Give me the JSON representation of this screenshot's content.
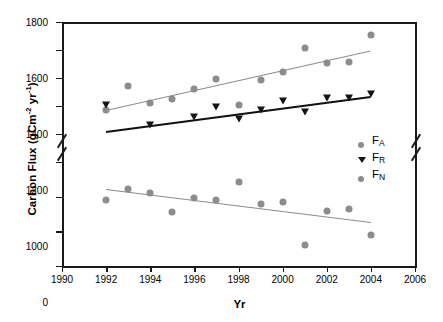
{
  "chart_data": {
    "type": "scatter",
    "title": "",
    "xlabel": "Yr",
    "ylabel": "Carbon Flux (gCm-2 yr-1)",
    "ylabel_parts": {
      "prefix": "Carbon Flux (gCm",
      "sup1": "-2",
      "mid": " yr",
      "sup2": "-1",
      "suffix": ")"
    },
    "xlim": [
      1990,
      2006
    ],
    "xticks": [
      1990,
      1992,
      1994,
      1996,
      1998,
      2000,
      2002,
      2004,
      2006
    ],
    "yticks_upper": [
      1000,
      1200,
      1400,
      1600,
      1800
    ],
    "yticks_lower": [
      -600,
      -400,
      -200,
      0
    ],
    "ylim_upper": [
      1000,
      1800
    ],
    "ylim_lower": [
      -600,
      0
    ],
    "axis_break": true,
    "axis_break_between": [
      1000,
      0
    ],
    "grid": false,
    "legend_position": "right-inside",
    "colors": {
      "gray_marker": "#8c8c8c",
      "black_marker": "#141414",
      "gray_fit": "#8c8c8c",
      "black_fit": "#111111",
      "frame": "#1a1a1a"
    },
    "series": [
      {
        "name": "FA",
        "label_base": "F",
        "label_sub": "A",
        "marker": "circle",
        "color": "#8c8c8c",
        "x": [
          1992,
          1993,
          1994,
          1995,
          1996,
          1997,
          1998,
          1999,
          2000,
          2001,
          2002,
          2003,
          2004
        ],
        "values": [
          1175,
          1345,
          1225,
          1250,
          1325,
          1390,
          1205,
          1385,
          1440,
          1615,
          1505,
          1512,
          1705
        ],
        "fit": {
          "x0": 1992,
          "y0": 1175,
          "x1": 2004,
          "y1": 1600,
          "color": "#8c8c8c",
          "width": 1.5
        }
      },
      {
        "name": "FR",
        "label_base": "F",
        "label_sub": "R",
        "marker": "triangle-down",
        "color": "#141414",
        "x": [
          1992,
          1994,
          1996,
          1997,
          1998,
          1999,
          2000,
          2001,
          2002,
          2003,
          2004
        ],
        "values": [
          1195,
          1050,
          1110,
          1180,
          1090,
          1155,
          1225,
          1145,
          1240,
          1245,
          1270
        ],
        "fit": {
          "x0": 1992,
          "y0": 1022,
          "x1": 2004,
          "y1": 1272,
          "color": "#111111",
          "width": 2.4
        }
      },
      {
        "name": "FN",
        "label_base": "F",
        "label_sub": "N",
        "marker": "circle",
        "color": "#8c8c8c",
        "x": [
          1992,
          1993,
          1994,
          1995,
          1996,
          1997,
          1998,
          1999,
          2000,
          2001,
          2002,
          2003,
          2004
        ],
        "values": [
          -222,
          -157,
          -180,
          -288,
          -210,
          -220,
          -113,
          -240,
          -232,
          -478,
          -282,
          -272,
          -420
        ],
        "fit": {
          "x0": 1992,
          "y0": -158,
          "x1": 2004,
          "y1": -348,
          "color": "#8c8c8c",
          "width": 1.5
        }
      }
    ]
  }
}
